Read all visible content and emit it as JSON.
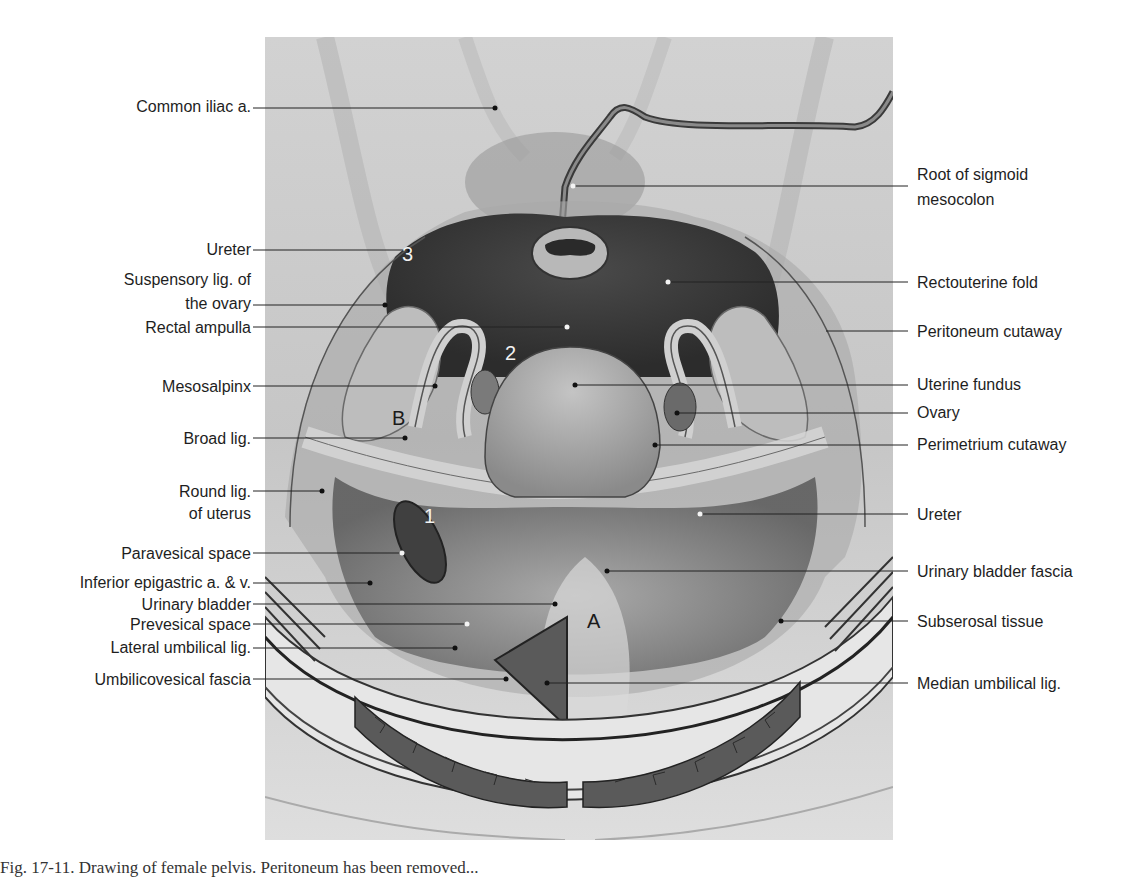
{
  "figure": {
    "colors": {
      "background": "#d4d4d4",
      "dark_cavity": "#3a3a3a",
      "uterus": "#a8a8a8",
      "line": "#222222"
    }
  },
  "labels_left": [
    {
      "text": "Common iliac a.",
      "y": 97,
      "target_x": 495,
      "target_y": 108
    },
    {
      "text": "Ureter",
      "y": 240,
      "target_x": 410,
      "target_y": 250
    },
    {
      "text": "Suspensory lig. of",
      "text2": "the ovary",
      "y": 289,
      "target_x": 385,
      "target_y": 305
    },
    {
      "text": "Rectal ampulla",
      "y": 318,
      "target_x": 567,
      "target_y": 327
    },
    {
      "text": "Mesosalpinx",
      "y": 374,
      "target_x": 435,
      "target_y": 386
    },
    {
      "text": "Broad lig.",
      "y": 428,
      "target_x": 405,
      "target_y": 438
    },
    {
      "text": "Round lig.",
      "text2": "of uterus",
      "y": 478,
      "target_x": 322,
      "target_y": 491
    },
    {
      "text": "Paravesical space",
      "y": 544,
      "target_x": 402,
      "target_y": 553
    },
    {
      "text": "Inferior epigastric a. & v.",
      "y": 572,
      "target_x": 370,
      "target_y": 583
    },
    {
      "text": "Urinary bladder",
      "y": 595,
      "target_x": 508,
      "target_y": 604
    },
    {
      "text": "Prevesical space",
      "y": 615,
      "target_x": 467,
      "target_y": 624
    },
    {
      "text": "Lateral umbilical lig.",
      "y": 638,
      "target_x": 424,
      "target_y": 648
    },
    {
      "text": "Umbilicovesical fascia",
      "y": 669,
      "target_x": 466,
      "target_y": 679
    }
  ],
  "labels_right": [
    {
      "text": "Root of sigmoid",
      "text2": "mesocolon",
      "y": 164,
      "target_x": 573,
      "target_y": 186
    },
    {
      "text": "Rectouterine fold",
      "y": 272,
      "target_x": 668,
      "target_y": 282
    },
    {
      "text": "Peritoneum cutaway",
      "y": 322,
      "target_x": 826,
      "target_y": 331
    },
    {
      "text": "Uterine fundus",
      "y": 374,
      "target_x": 575,
      "target_y": 385
    },
    {
      "text": "Ovary",
      "y": 402,
      "target_x": 677,
      "target_y": 413
    },
    {
      "text": "Perimetrium cutaway",
      "y": 434,
      "target_x": 655,
      "target_y": 445
    },
    {
      "text": "Ureter",
      "y": 506,
      "target_x": 700,
      "target_y": 514
    },
    {
      "text": "Urinary bladder fascia",
      "y": 563,
      "target_x": 607,
      "target_y": 571
    },
    {
      "text": "Subserosal tissue",
      "y": 614,
      "target_x": 781,
      "target_y": 621
    },
    {
      "text": "Median umbilical lig.",
      "y": 680,
      "target_x": 527,
      "target_y": 683
    }
  ],
  "markers": [
    {
      "text": "3",
      "x": 402,
      "y": 246,
      "color": "white"
    },
    {
      "text": "2",
      "x": 505,
      "y": 345,
      "color": "white"
    },
    {
      "text": "B",
      "x": 393,
      "y": 410,
      "color": "black"
    },
    {
      "text": "1",
      "x": 424,
      "y": 507,
      "color": "white"
    },
    {
      "text": "A",
      "x": 588,
      "y": 612,
      "color": "black"
    }
  ],
  "caption": "Fig. 17-11. Drawing of female pelvis. Peritoneum has been removed..."
}
